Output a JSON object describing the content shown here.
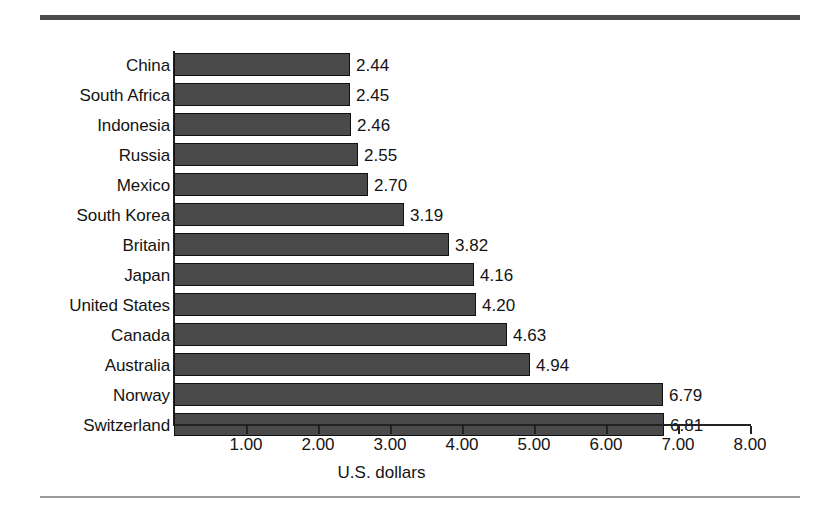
{
  "figure": {
    "top_rule_color": "#4b4b4b",
    "bottom_rule_color": "#9a9a9a",
    "bar_color": "#4a4a4a",
    "bar_border_color": "#111111",
    "axis_color": "#222222",
    "background": "#ffffff"
  },
  "chart_data": {
    "type": "bar",
    "orientation": "horizontal",
    "title": "",
    "subtitle": "",
    "xlabel": "U.S. dollars",
    "ylabel": "",
    "xlim": [
      0,
      8
    ],
    "ylim": null,
    "grid": false,
    "legend": null,
    "x_ticks": [
      "1.00",
      "2.00",
      "3.00",
      "4.00",
      "5.00",
      "6.00",
      "7.00",
      "8.00"
    ],
    "x_tick_values": [
      1,
      2,
      3,
      4,
      5,
      6,
      7,
      8
    ],
    "categories": [
      "China",
      "South Africa",
      "Indonesia",
      "Russia",
      "Mexico",
      "South Korea",
      "Britain",
      "Japan",
      "United States",
      "Canada",
      "Australia",
      "Norway",
      "Switzerland"
    ],
    "values": [
      2.44,
      2.45,
      2.46,
      2.55,
      2.7,
      3.19,
      3.82,
      4.16,
      4.2,
      4.63,
      4.94,
      6.79,
      6.81
    ],
    "value_labels": [
      "2.44",
      "2.45",
      "2.46",
      "2.55",
      "2.70",
      "3.19",
      "3.82",
      "4.16",
      "4.20",
      "4.63",
      "4.94",
      "6.79",
      "6.81"
    ],
    "annotations": []
  }
}
